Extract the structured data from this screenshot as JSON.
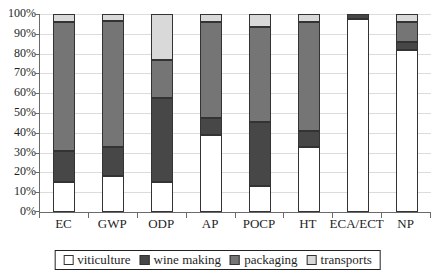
{
  "chart_data": {
    "type": "bar",
    "stacked": true,
    "percent_stacked": true,
    "title": "",
    "xlabel": "",
    "ylabel": "",
    "ylim": [
      0,
      100
    ],
    "ytick_step": 10,
    "ytick_labels": [
      "0%",
      "10%",
      "20%",
      "30%",
      "40%",
      "50%",
      "60%",
      "70%",
      "80%",
      "90%",
      "100%"
    ],
    "grid": true,
    "legend_position": "bottom",
    "categories": [
      "EC",
      "GWP",
      "ODP",
      "AP",
      "POCP",
      "HT",
      "ECA/ECT",
      "NP"
    ],
    "series": [
      {
        "name": "viticulture",
        "color": "#ffffff",
        "values": [
          15,
          18,
          15,
          39,
          13,
          33,
          97.5,
          82
        ]
      },
      {
        "name": "wine making",
        "color": "#474747",
        "values": [
          16,
          15,
          42.5,
          8.5,
          32.5,
          8,
          2.5,
          4
        ]
      },
      {
        "name": "packaging",
        "color": "#757575",
        "values": [
          65,
          63.5,
          19.5,
          48.5,
          48,
          55,
          0,
          10
        ]
      },
      {
        "name": "transports",
        "color": "#d9d9d9",
        "values": [
          4,
          3.5,
          23,
          4,
          6.5,
          4,
          0,
          4
        ]
      }
    ],
    "colors": {
      "gridline": "#dcdcdc",
      "axis": "#6a6a6a",
      "segment_border": "#333333",
      "text": "#1f1f1f"
    }
  }
}
